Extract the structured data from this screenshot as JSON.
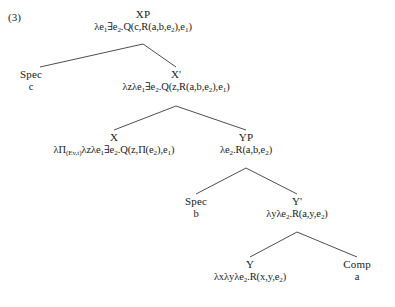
{
  "figure": {
    "example_number": "(3)",
    "type": "syntax-tree",
    "line_color": "#3a3a3a"
  },
  "nodes": {
    "xp": {
      "label": "XP",
      "formula_html": "&#955;e<sub>1</sub>&#8707;e<sub>2</sub>.Q(c,R(a,b,e<sub>2</sub>),e<sub>1</sub>)",
      "formula_text": "λe₁∃e₂.Q(c,R(a,b,e₂),e₁)"
    },
    "spec_upper": {
      "label": "Spec",
      "terminal": "c"
    },
    "xbar": {
      "label": "X'",
      "formula_html": "&#955;z&#955;e<sub>1</sub>&#8707;e<sub>2</sub>.Q(z,R(a,b,e<sub>2</sub>),e<sub>1</sub>)",
      "formula_text": "λzλe₁∃e₂.Q(z,R(a,b,e₂),e₁)"
    },
    "x": {
      "label": "X",
      "formula_html": "&#955;&#928;<sub>(Ev,t)</sub>&#955;z&#955;e<sub>1</sub>&#8707;e<sub>2</sub>.Q(z,&#928;(e<sub>2</sub>),e<sub>1</sub>)",
      "formula_text": "λΠ₍ᴱᵥ,ₜ₎λzλe₁∃e₂.Q(z,Π(e₂),e₁)"
    },
    "yp": {
      "label": "YP",
      "formula_html": "&#955;e<sub>2</sub>.R(a,b,e<sub>2</sub>)",
      "formula_text": "λe₂.R(a,b,e₂)"
    },
    "spec_lower": {
      "label": "Spec",
      "terminal": "b"
    },
    "ybar": {
      "label": "Y'",
      "formula_html": "&#955;y&#955;e<sub>2</sub>.R(a,y,e<sub>2</sub>)",
      "formula_text": "λyλe₂.R(a,y,e₂)"
    },
    "y": {
      "label": "Y",
      "formula_html": "&#955;x&#955;y&#955;e<sub>2</sub>.R(x,y,e<sub>2</sub>)",
      "formula_text": "λxλyλe₂.R(x,y,e₂)"
    },
    "comp": {
      "label": "Comp",
      "terminal": "a"
    }
  }
}
